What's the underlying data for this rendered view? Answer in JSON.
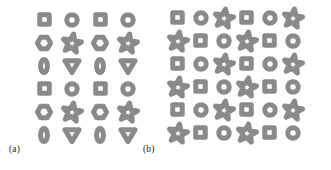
{
  "figure": {
    "background_color": "#ffffff",
    "stroke_color": "#8a8a8a",
    "label_color": "#262626"
  },
  "panels": [
    {
      "id": "a",
      "label": "(a)",
      "rows": 6,
      "cols": 4,
      "cell_w": 28,
      "cell_h": 23,
      "grid": [
        [
          "square",
          "circle",
          "square",
          "circle"
        ],
        [
          "hexagon",
          "star",
          "hexagon",
          "star"
        ],
        [
          "ellipse",
          "triangle-down",
          "ellipse",
          "triangle-down"
        ],
        [
          "square",
          "circle",
          "square",
          "circle"
        ],
        [
          "hexagon",
          "star",
          "hexagon",
          "star"
        ],
        [
          "ellipse",
          "triangle-down",
          "ellipse",
          "triangle-down"
        ]
      ]
    },
    {
      "id": "b",
      "label": "(b)",
      "rows": 6,
      "cols": 6,
      "cell_w": 23,
      "cell_h": 23,
      "grid": [
        [
          "square",
          "circle",
          "star",
          "square",
          "circle",
          "star"
        ],
        [
          "star",
          "square",
          "circle",
          "star",
          "square",
          "circle"
        ],
        [
          "square",
          "circle",
          "star",
          "square",
          "circle",
          "star"
        ],
        [
          "star",
          "square",
          "circle",
          "star",
          "square",
          "circle"
        ],
        [
          "square",
          "circle",
          "star",
          "square",
          "circle",
          "star"
        ],
        [
          "star",
          "square",
          "circle",
          "star",
          "square",
          "circle"
        ]
      ]
    }
  ],
  "shape_sizes": {
    "square": 17,
    "circle": 18,
    "hexagon": 20,
    "star": 24,
    "ellipse": 20,
    "triangle-down": 22
  }
}
